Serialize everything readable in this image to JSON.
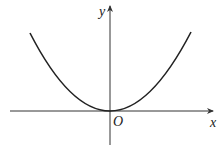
{
  "diagram": {
    "type": "function-graph",
    "function": "y = x^2",
    "curve": "parabola opening upward with vertex at origin",
    "labels": {
      "x_axis": "x",
      "y_axis": "y",
      "origin": "O"
    },
    "colors": {
      "curve": "#222222",
      "axes": "#333333",
      "background": "#ffffff"
    }
  }
}
